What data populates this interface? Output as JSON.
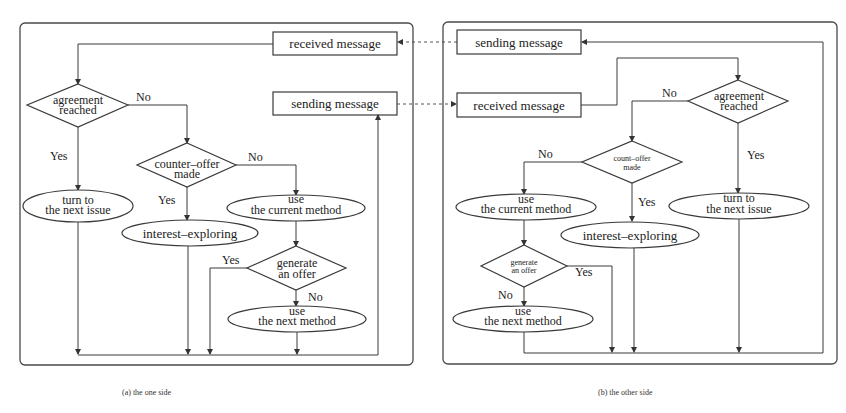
{
  "figure": {
    "left": {
      "caption": "(a) the one side",
      "received": "received message",
      "sending": "sending message",
      "agreement": [
        "agreement",
        "reached"
      ],
      "counter_offer": [
        "counter–offer",
        "made"
      ],
      "turn_to": [
        "turn to",
        "the next issue"
      ],
      "interest": "interest–exploring",
      "use_current": [
        "use",
        "the current method"
      ],
      "generate": [
        "generate",
        "an offer"
      ],
      "use_next": [
        "use",
        "the next method"
      ],
      "labels": {
        "no1": "No",
        "yes1": "Yes",
        "no2": "No",
        "yes2": "Yes",
        "yes3": "Yes",
        "no3": "No"
      }
    },
    "right": {
      "caption": "(b) the other side",
      "sending": "sending message",
      "received": "received message",
      "agreement": [
        "agreement",
        "reached"
      ],
      "count_offer": [
        "count–offer",
        "made"
      ],
      "turn_to": [
        "turn to",
        "the next issue"
      ],
      "interest": "interest–exploring",
      "use_current": [
        "use",
        "the current method"
      ],
      "generate": [
        "generate",
        "an offer"
      ],
      "use_next": [
        "use",
        "the next method"
      ],
      "labels": {
        "no1": "No",
        "yes1": "Yes",
        "no2": "No",
        "yes2": "Yes",
        "yes3": "Yes",
        "no3": "No"
      }
    }
  }
}
